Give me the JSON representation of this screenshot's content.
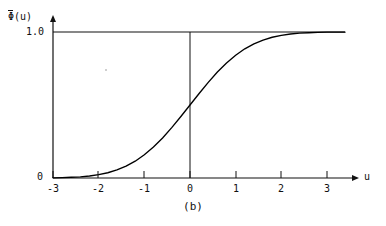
{
  "figure": {
    "caption": "(b)",
    "ylabel": {
      "symbol": "Φ",
      "overbar": true,
      "argument": "(u)",
      "full": "Φ̄(u)"
    },
    "xlabel": "u",
    "y_ticks": [
      {
        "value": 1.0,
        "label": "1.0"
      },
      {
        "value": 0.0,
        "label": "0"
      }
    ],
    "x_ticks": [
      {
        "value": -3,
        "label": "-3"
      },
      {
        "value": -2,
        "label": "-2"
      },
      {
        "value": -1,
        "label": "-1"
      },
      {
        "value": 0,
        "label": "0"
      },
      {
        "value": 1,
        "label": "1"
      },
      {
        "value": 2,
        "label": "2"
      },
      {
        "value": 3,
        "label": "3"
      }
    ],
    "colors": {
      "ink": "#111111",
      "curve": "#000000",
      "background": "#ffffff"
    }
  },
  "chart_data": {
    "type": "line",
    "title": "",
    "subtitle": "",
    "caption": "(b)",
    "xlabel": "u",
    "ylabel": "Φ̄(u)",
    "xlim": [
      -3,
      3
    ],
    "ylim": [
      0,
      1.0
    ],
    "grid": false,
    "legend": null,
    "xticks": [
      -3,
      -2,
      -1,
      0,
      1,
      2,
      3
    ],
    "xticklabels": [
      "-3",
      "-2",
      "-1",
      "0",
      "1",
      "2",
      "3"
    ],
    "yticks": [
      0,
      1.0
    ],
    "yticklabels": [
      "0",
      "1.0"
    ],
    "annotations": [
      {
        "kind": "horizontal-asymptote-line",
        "y": 1.0,
        "x_from": -3,
        "x_to": 2.8
      },
      {
        "kind": "vertical-reference-line",
        "x": 0,
        "y_from": 0,
        "y_to": 1.0
      }
    ],
    "series": [
      {
        "name": "Φ̄(u)",
        "type": "line",
        "x": [
          -3,
          -2.8,
          -2.6,
          -2.4,
          -2.2,
          -2,
          -1.8,
          -1.6,
          -1.4,
          -1.2,
          -1,
          -0.8,
          -0.6,
          -0.4,
          -0.2,
          0,
          0.2,
          0.4,
          0.6,
          0.8,
          1,
          1.2,
          1.4,
          1.6,
          1.8,
          2,
          2.2,
          2.4,
          2.6,
          2.8,
          3
        ],
        "values": [
          0.001,
          0.003,
          0.005,
          0.008,
          0.014,
          0.023,
          0.036,
          0.055,
          0.081,
          0.115,
          0.159,
          0.212,
          0.274,
          0.345,
          0.421,
          0.5,
          0.579,
          0.655,
          0.726,
          0.788,
          0.841,
          0.885,
          0.919,
          0.945,
          0.964,
          0.977,
          0.986,
          0.992,
          0.995,
          0.997,
          0.999
        ]
      }
    ]
  }
}
